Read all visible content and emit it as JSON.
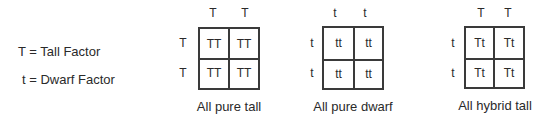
{
  "legend": {
    "tall": "T = Tall Factor",
    "dwarf": "t = Dwarf Factor"
  },
  "squares": [
    {
      "top": [
        "T",
        "T"
      ],
      "left": [
        "T",
        "T"
      ],
      "cells": [
        [
          "TT",
          "TT"
        ],
        [
          "TT",
          "TT"
        ]
      ],
      "caption": "All pure tall"
    },
    {
      "top": [
        "t",
        "t"
      ],
      "left": [
        "t",
        "t"
      ],
      "cells": [
        [
          "tt",
          "tt"
        ],
        [
          "tt",
          "tt"
        ]
      ],
      "caption": "All pure dwarf"
    },
    {
      "top": [
        "T",
        "T"
      ],
      "left": [
        "t",
        "t"
      ],
      "cells": [
        [
          "Tt",
          "Tt"
        ],
        [
          "Tt",
          "Tt"
        ]
      ],
      "caption": "All hybrid tall"
    }
  ]
}
